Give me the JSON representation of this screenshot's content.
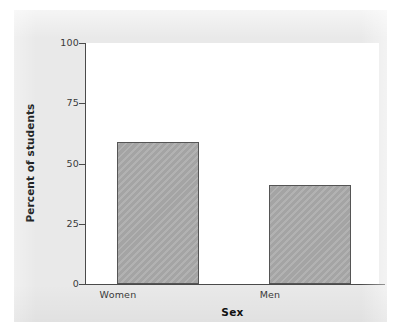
{
  "figure": {
    "background_color": "#e9e9e9",
    "plot_background_color": "#ffffff",
    "axis_color": "#4a4a4a",
    "bar_fill_color": "#a9a9a9",
    "bar_edge_color": "#555555"
  },
  "chart_data": {
    "type": "bar",
    "title": "",
    "subtitle": "",
    "categories": [
      "Women",
      "Men"
    ],
    "values": [
      59,
      41
    ],
    "xlabel": "Sex",
    "ylabel": "Percent of students",
    "ylim": [
      0,
      100
    ],
    "yticks": [
      0,
      25,
      50,
      75,
      100
    ],
    "ytick_labels": [
      "0",
      "25",
      "50",
      "75",
      "100"
    ],
    "xtick_labels": [
      "Women",
      "Men"
    ],
    "grid": false,
    "legend": null,
    "annotations": [],
    "series": [
      {
        "name": "Percent of students",
        "values": [
          59,
          41
        ]
      }
    ]
  }
}
